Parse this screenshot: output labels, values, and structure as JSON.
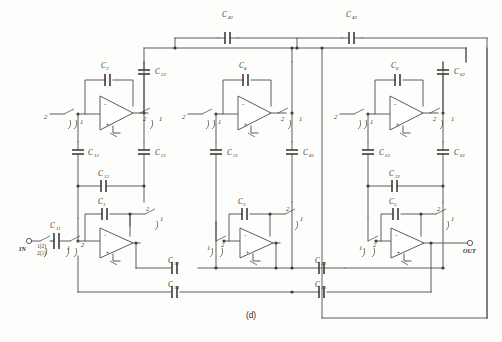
{
  "figure": {
    "caption": "(d)",
    "type": "switched-capacitor-ladder-filter-schematic"
  },
  "terminals": [
    {
      "id": "in",
      "label": "IN",
      "x": 22,
      "y": 241
    },
    {
      "id": "out",
      "label": "OUT",
      "x": 470,
      "y": 241
    }
  ],
  "input_switch_labels": {
    "top": "1(2)",
    "bottom": "2(1)"
  },
  "opamps": [
    {
      "id": "A2",
      "row": "top",
      "feedback_cap": "C2",
      "x": 118,
      "y": 108
    },
    {
      "id": "A4",
      "row": "top",
      "feedback_cap": "C4",
      "x": 253,
      "y": 108
    },
    {
      "id": "A6",
      "row": "top",
      "feedback_cap": "C6",
      "x": 404,
      "y": 108
    },
    {
      "id": "A1",
      "row": "bottom",
      "feedback_cap": "C1",
      "x": 118,
      "y": 241
    },
    {
      "id": "A3",
      "row": "bottom",
      "feedback_cap": "C3",
      "x": 253,
      "y": 241
    },
    {
      "id": "A5",
      "row": "bottom",
      "feedback_cap": "C5",
      "x": 404,
      "y": 241
    }
  ],
  "capacitors": {
    "feedback": [
      {
        "name": "C",
        "sub": "2",
        "x": 107,
        "y": 72,
        "orient": "v"
      },
      {
        "name": "C",
        "sub": "4",
        "x": 245,
        "y": 72,
        "orient": "v"
      },
      {
        "name": "C",
        "sub": "6",
        "x": 397,
        "y": 72,
        "orient": "v"
      },
      {
        "name": "C",
        "sub": "1",
        "x": 104,
        "y": 206,
        "orient": "v"
      },
      {
        "name": "C",
        "sub": "3",
        "x": 244,
        "y": 206,
        "orient": "v"
      },
      {
        "name": "C",
        "sub": "5",
        "x": 395,
        "y": 206,
        "orient": "v"
      }
    ],
    "top_rail": [
      {
        "name": "C",
        "sub": "42",
        "x": 228,
        "y": 22,
        "orient": "h"
      },
      {
        "name": "C",
        "sub": "43",
        "x": 352,
        "y": 22,
        "orient": "h"
      }
    ],
    "vertical_branch": [
      {
        "name": "C",
        "sub": "22",
        "x": 144,
        "y": 72,
        "orient": "v"
      },
      {
        "name": "C",
        "sub": "62",
        "x": 443,
        "y": 72,
        "orient": "v"
      },
      {
        "name": "C",
        "sub": "12",
        "x": 78,
        "y": 152,
        "orient": "v"
      },
      {
        "name": "C",
        "sub": "21",
        "x": 144,
        "y": 152,
        "orient": "v"
      },
      {
        "name": "C",
        "sub": "31",
        "x": 216,
        "y": 152,
        "orient": "v"
      },
      {
        "name": "C",
        "sub": "41",
        "x": 292,
        "y": 152,
        "orient": "v"
      },
      {
        "name": "C",
        "sub": "52",
        "x": 363,
        "y": 152,
        "orient": "v"
      },
      {
        "name": "C",
        "sub": "61",
        "x": 437,
        "y": 152,
        "orient": "v"
      }
    ],
    "series": [
      {
        "name": "C",
        "sub": "13",
        "x": 104,
        "y": 181,
        "orient": "h"
      },
      {
        "name": "C",
        "sub": "11",
        "x": 57,
        "y": 226,
        "orient": "h"
      },
      {
        "name": "C",
        "sub": "32",
        "x": 174,
        "y": 268,
        "orient": "h"
      },
      {
        "name": "C",
        "sub": "33",
        "x": 320,
        "y": 268,
        "orient": "h"
      },
      {
        "name": "C",
        "sub": "34",
        "x": 174,
        "y": 292,
        "orient": "h"
      },
      {
        "name": "C",
        "sub": "13",
        "x": 320,
        "y": 292,
        "orient": "h"
      }
    ]
  },
  "switch_phase_labels": {
    "phase_one": "1",
    "phase_two": "2"
  },
  "opamp_pin_marks": {
    "inverting": "−",
    "noninverting": "+"
  }
}
